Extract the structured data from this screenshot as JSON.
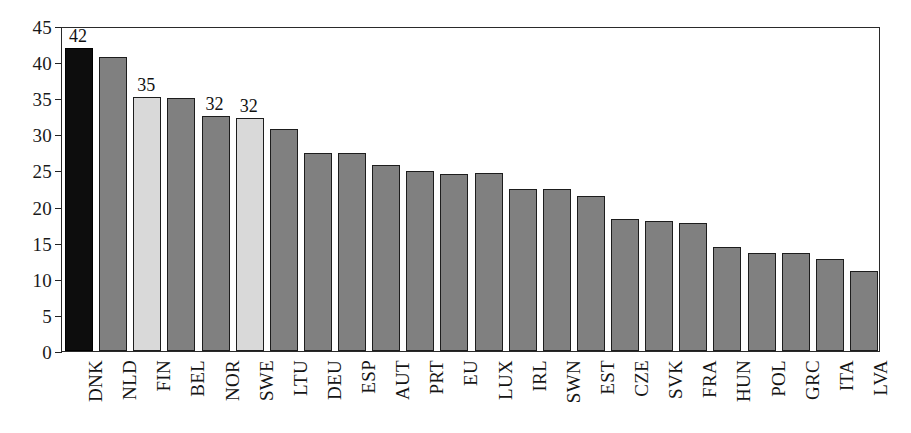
{
  "chart_data": {
    "type": "bar",
    "title": "",
    "subtitle": "",
    "xlabel": "",
    "ylabel": "",
    "ylim": [
      0,
      45
    ],
    "ytick_step": 5,
    "ytick_labels": [
      "0",
      "5",
      "10",
      "15",
      "20",
      "25",
      "30",
      "35",
      "40",
      "45"
    ],
    "grid": false,
    "legend": false,
    "categories": [
      "DNK",
      "NLD",
      "FIN",
      "BEL",
      "NOR",
      "SWE",
      "LTU",
      "DEU",
      "ESP",
      "AUT",
      "PRT",
      "EU",
      "LUX",
      "IRL",
      "SWN",
      "EST",
      "CZE",
      "SVK",
      "FRA",
      "HUN",
      "POL",
      "GRC",
      "ITA",
      "LVA"
    ],
    "values": [
      42.0,
      40.7,
      35.2,
      35.1,
      32.5,
      32.2,
      30.7,
      27.4,
      27.4,
      25.8,
      24.9,
      24.5,
      24.6,
      22.4,
      22.4,
      21.5,
      18.3,
      18.0,
      17.7,
      14.4,
      13.6,
      13.6,
      12.8,
      11.1
    ],
    "bar_styles": [
      "highlight-dark",
      "normal",
      "highlight-light",
      "normal",
      "normal",
      "highlight-light",
      "normal",
      "normal",
      "normal",
      "normal",
      "normal",
      "normal",
      "normal",
      "normal",
      "normal",
      "normal",
      "normal",
      "normal",
      "normal",
      "normal",
      "normal",
      "normal",
      "normal",
      "normal"
    ],
    "data_labels": [
      {
        "category": "DNK",
        "text": "42"
      },
      {
        "category": "FIN",
        "text": "35"
      },
      {
        "category": "NOR",
        "text": "32"
      },
      {
        "category": "SWE",
        "text": "32"
      }
    ],
    "colors": {
      "highlight_dark": "#0d0d0d",
      "highlight_light": "#d9d9d9",
      "normal": "#808080",
      "axis": "#2a2a2a",
      "text": "#111111",
      "background": "#ffffff"
    }
  }
}
